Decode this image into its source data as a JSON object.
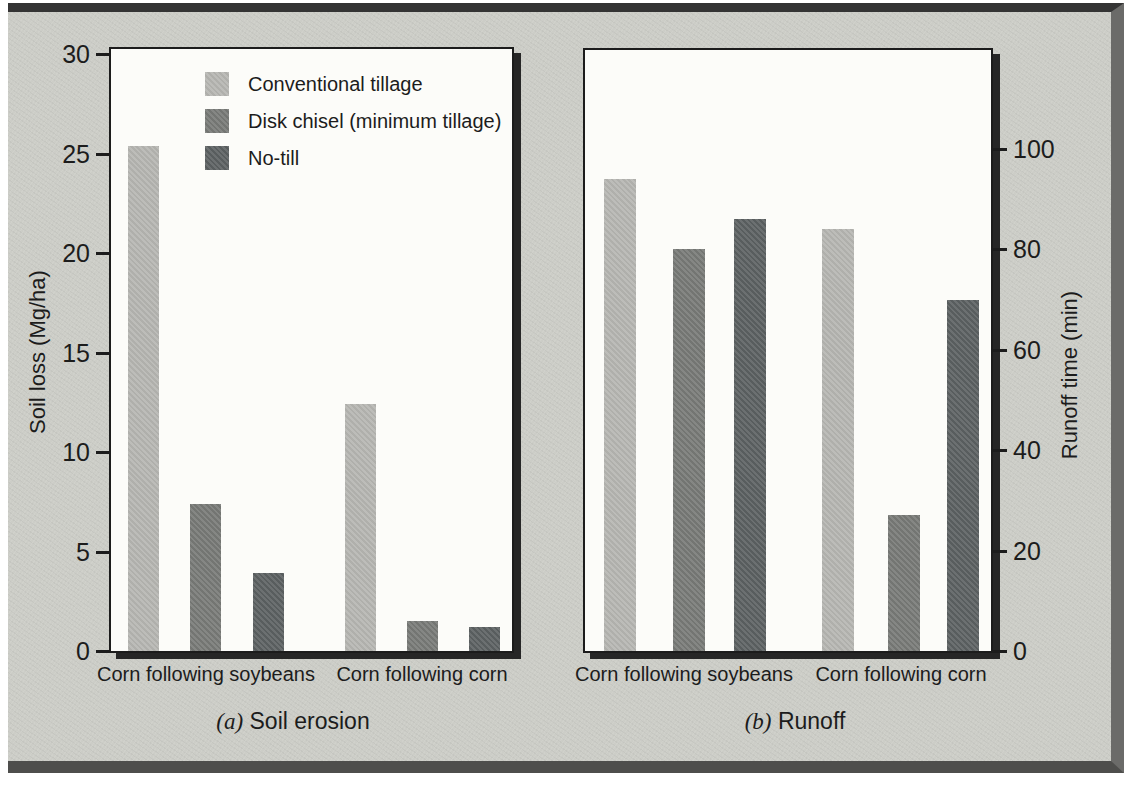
{
  "figure": {
    "page_bg": "#ffffff",
    "panel_bg": "#cccdc7",
    "plot_bg": "#fcfcf9",
    "axis_color": "#1c1c1c",
    "text_color": "#1c1c1c",
    "panel_border_top": "#343434",
    "panel_border_right": "#6b6b69",
    "panel_border_bottom": "#4e4e4c",
    "plot_shadow": "#262626"
  },
  "legend": {
    "items": [
      {
        "label": "Conventional tillage",
        "color": "#b5b5b1"
      },
      {
        "label": "Disk chisel (minimum tillage)",
        "color": "#777976"
      },
      {
        "label": "No-till",
        "color": "#5b6061"
      }
    ]
  },
  "chart_data": [
    {
      "id": "soil-erosion",
      "type": "bar",
      "caption_prefix": "(a)",
      "caption": "Soil erosion",
      "ylabel": "Soil loss (Mg/ha)",
      "yaxis_side": "left",
      "ylim": [
        0,
        30
      ],
      "yticks": [
        0,
        5,
        10,
        15,
        20,
        25,
        30
      ],
      "grid": false,
      "legend_position": "inside-top-left",
      "categories": [
        "Corn following soybeans",
        "Corn following corn"
      ],
      "series": [
        {
          "name": "Conventional tillage",
          "color": "#b5b5b1",
          "values": [
            25.4,
            12.4
          ]
        },
        {
          "name": "Disk chisel (minimum tillage)",
          "color": "#777976",
          "values": [
            7.4,
            1.5
          ]
        },
        {
          "name": "No-till",
          "color": "#5b6061",
          "values": [
            3.9,
            1.2
          ]
        }
      ]
    },
    {
      "id": "runoff",
      "type": "bar",
      "caption_prefix": "(b)",
      "caption": "Runoff",
      "ylabel": "Runoff time (min)",
      "yaxis_side": "right",
      "ylim": [
        0,
        120
      ],
      "yticks": [
        0,
        20,
        40,
        60,
        80,
        100
      ],
      "grid": false,
      "legend_position": "none",
      "categories": [
        "Corn following soybeans",
        "Corn following corn"
      ],
      "series": [
        {
          "name": "Conventional tillage",
          "color": "#b5b5b1",
          "values": [
            94,
            84
          ]
        },
        {
          "name": "Disk chisel (minimum tillage)",
          "color": "#777976",
          "values": [
            80,
            27
          ]
        },
        {
          "name": "No-till",
          "color": "#5b6061",
          "values": [
            86,
            70
          ]
        }
      ]
    }
  ]
}
